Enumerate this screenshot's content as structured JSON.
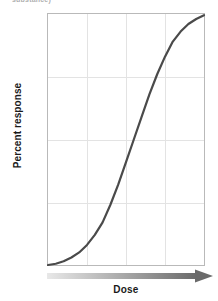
{
  "figure": {
    "cutoff_text": "substance)",
    "background_color": "#ffffff"
  },
  "chart_data": {
    "type": "line",
    "title": "",
    "xlabel": "Dose",
    "ylabel": "Percent response",
    "ylim": [
      0,
      100
    ],
    "yticks": [
      0,
      50,
      100
    ],
    "ytick_labels": [
      "0",
      "50",
      "100"
    ],
    "xticks": [],
    "xtick_labels": [],
    "grid": true,
    "grid_color": "#e3e3e3",
    "grid_vertical_divisions": 4,
    "grid_horizontal_divisions": 4,
    "legend": null,
    "axis_arrow": {
      "direction": "right",
      "gradient_from": "#e8e8e8",
      "gradient_to": "#6a6a6a"
    },
    "series": [
      {
        "name": "Dose-response",
        "color": "#4a4a4a",
        "line_width": 2,
        "shape": "sigmoid",
        "x": [
          0,
          5,
          10,
          15,
          20,
          25,
          30,
          35,
          40,
          45,
          50,
          55,
          60,
          65,
          70,
          75,
          80,
          85,
          90,
          95,
          100
        ],
        "values": [
          0,
          0.5,
          1.5,
          3,
          5,
          8,
          12,
          17,
          24,
          32,
          41,
          50,
          59,
          68,
          76,
          83,
          89,
          93,
          96,
          98,
          99.5
        ]
      }
    ]
  },
  "colors": {
    "curve": "#4a4a4a",
    "frame": "#b9b9b9",
    "grid": "#e3e3e3",
    "text": "#1a1a1a"
  }
}
